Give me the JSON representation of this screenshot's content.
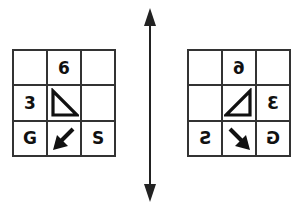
{
  "diagram": {
    "type": "mirror-reflection",
    "mirror_axis": "vertical",
    "left_grid": {
      "cells": [
        {
          "row": 0,
          "col": 0,
          "content": ""
        },
        {
          "row": 0,
          "col": 1,
          "content": "6"
        },
        {
          "row": 0,
          "col": 2,
          "content": ""
        },
        {
          "row": 1,
          "col": 0,
          "content": "3"
        },
        {
          "row": 1,
          "col": 1,
          "content": "triangle-right-angle-bottom-left"
        },
        {
          "row": 1,
          "col": 2,
          "content": ""
        },
        {
          "row": 2,
          "col": 0,
          "content": "G"
        },
        {
          "row": 2,
          "col": 1,
          "content": "arrow-down-left"
        },
        {
          "row": 2,
          "col": 2,
          "content": "S"
        }
      ]
    },
    "right_grid": {
      "cells": [
        {
          "row": 0,
          "col": 0,
          "content": ""
        },
        {
          "row": 0,
          "col": 1,
          "content": "6 (mirrored)"
        },
        {
          "row": 0,
          "col": 2,
          "content": ""
        },
        {
          "row": 1,
          "col": 0,
          "content": ""
        },
        {
          "row": 1,
          "col": 1,
          "content": "triangle-right-angle-bottom-right"
        },
        {
          "row": 1,
          "col": 2,
          "content": "3 (mirrored)"
        },
        {
          "row": 2,
          "col": 0,
          "content": "S (mirrored)"
        },
        {
          "row": 2,
          "col": 1,
          "content": "arrow-down-right"
        },
        {
          "row": 2,
          "col": 2,
          "content": "G (mirrored)"
        }
      ]
    },
    "labels": {
      "six": "6",
      "three": "3",
      "g": "G",
      "s": "S"
    },
    "colors": {
      "ink": "#111111",
      "grid_line": "#333333",
      "background": "#ffffff"
    }
  }
}
